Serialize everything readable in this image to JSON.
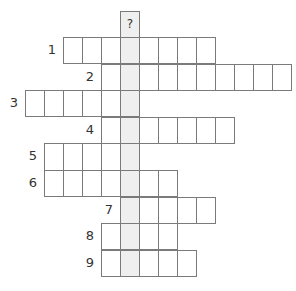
{
  "puzzle": {
    "type": "crossword-keyword",
    "key_column": 3,
    "key_label": "?",
    "grid": {
      "origin_x": 63,
      "origin_y": 37,
      "cell_w": 19,
      "cell_h": 26.6,
      "key_top_y": 10.5
    },
    "colors": {
      "line": "#7a7a7a",
      "key_fill": "#efefef",
      "cell_fill": "#ffffff",
      "label": "#333333"
    },
    "rows": [
      {
        "number": "1",
        "start_col": 0,
        "length": 8
      },
      {
        "number": "2",
        "start_col": 2,
        "length": 10
      },
      {
        "number": "3",
        "start_col": -2,
        "length": 6
      },
      {
        "number": "4",
        "start_col": 2,
        "length": 7
      },
      {
        "number": "5",
        "start_col": -1,
        "length": 5
      },
      {
        "number": "6",
        "start_col": -1,
        "length": 7
      },
      {
        "number": "7",
        "start_col": 3,
        "length": 5
      },
      {
        "number": "8",
        "start_col": 2,
        "length": 4
      },
      {
        "number": "9",
        "start_col": 2,
        "length": 5
      }
    ]
  }
}
